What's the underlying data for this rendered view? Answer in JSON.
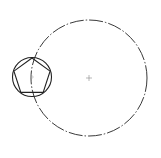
{
  "diagram": {
    "type": "cad-sketch",
    "stroke_color": "#222222",
    "large_circle": {
      "cx": 89,
      "cy": 78,
      "r": 58,
      "style": "dash-dot"
    },
    "center_mark": {
      "cx": 89,
      "cy": 78,
      "size": 3
    },
    "small_circle": {
      "cx": 32,
      "cy": 77,
      "r": 19.5,
      "style": "solid"
    },
    "pentagon": {
      "cx": 32,
      "cy": 77,
      "r": 19,
      "rotation_deg": -90,
      "style": "solid"
    },
    "small_center_mark": {
      "cx": 32,
      "cy": 77,
      "size": 2
    }
  }
}
